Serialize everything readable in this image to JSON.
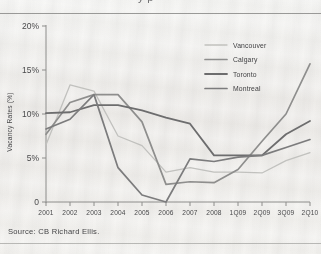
{
  "figure": {
    "cropped_title_fragment": "y p",
    "source_note": "Source: CB Richard Ellis."
  },
  "chart_data": {
    "type": "line",
    "title": "",
    "xlabel": "",
    "ylabel": "Vacancy Rates (%)",
    "grid": false,
    "legend_position": "top-right",
    "ylim": [
      0,
      20
    ],
    "yticks": [
      0,
      5,
      10,
      15,
      20
    ],
    "ytick_labels": [
      "0",
      "5%",
      "10%",
      "15%",
      "20%"
    ],
    "categories": [
      "2001",
      "2002",
      "2003",
      "2004",
      "2005",
      "2006",
      "2007",
      "2008",
      "1Q09",
      "2Q09",
      "3Q09",
      "2Q10"
    ],
    "series": [
      {
        "name": "Vancouver",
        "color": "#c2c2bf",
        "width": 1.3,
        "values": [
          6.5,
          13.3,
          12.6,
          7.5,
          6.4,
          3.4,
          3.9,
          3.4,
          3.4,
          3.3,
          4.7,
          5.6
        ]
      },
      {
        "name": "Calgary",
        "color": "#8f8f8e",
        "width": 1.7,
        "values": [
          7.7,
          11.3,
          12.2,
          12.2,
          9.1,
          2.0,
          2.3,
          2.2,
          3.7,
          6.9,
          10.0,
          15.7
        ]
      },
      {
        "name": "Toronto",
        "color": "#6d6d6e",
        "width": 1.8,
        "values": [
          10.1,
          10.2,
          11.0,
          11.0,
          10.4,
          9.6,
          8.9,
          5.3,
          5.3,
          5.3,
          7.7,
          9.2
        ]
      },
      {
        "name": "Montreal",
        "color": "#7c7c7d",
        "width": 1.7,
        "values": [
          8.3,
          9.4,
          12.2,
          3.9,
          0.8,
          0.0,
          4.9,
          4.6,
          5.1,
          5.3,
          6.2,
          7.1
        ]
      }
    ]
  }
}
